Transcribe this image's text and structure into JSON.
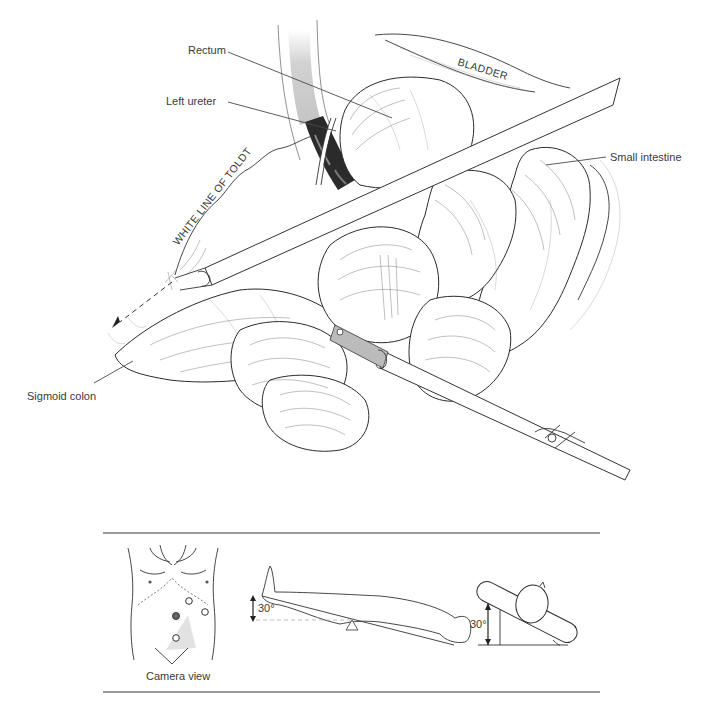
{
  "figure": {
    "type": "surgical-illustration",
    "main_view": {
      "labels": {
        "rectum": "Rectum",
        "left_ureter": "Left ureter",
        "bladder": "BLADDER",
        "small_intestine": "Small intestine",
        "white_line_of_toldt": "WHITE LINE OF TOLDT",
        "sigmoid_colon": "Sigmoid colon"
      }
    },
    "inset_panel": {
      "camera_view_caption": "Camera view",
      "tilt_angle_side": "30°",
      "tilt_angle_end": "30°",
      "port_count": 4
    },
    "colors": {
      "line": "#2a2a2a",
      "label_text": "#3a3a3a",
      "rule": "#777777",
      "ureter_dark": "#2b2b2b",
      "rectum_shade": "#cfcfcf",
      "camera_field": "#e2e2e2"
    }
  }
}
